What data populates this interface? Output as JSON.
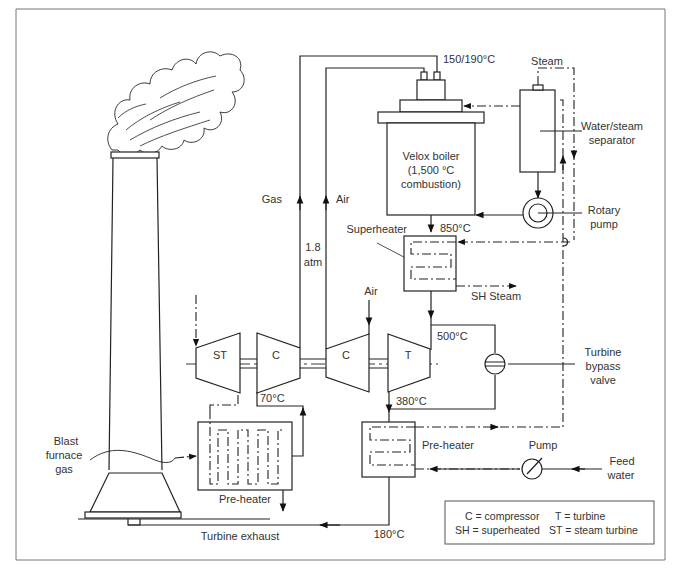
{
  "diagram": {
    "type": "process flow schematic",
    "components": {
      "chimney": "chimney-stack",
      "boiler": {
        "line1": "Velox boiler",
        "line2": "(1,500 °C",
        "line3": "combustion)"
      },
      "separator": {
        "line1": "Water/steam",
        "line2": "separator"
      },
      "rotary_pump": {
        "line1": "Rotary",
        "line2": "pump"
      },
      "superheater": "Superheater",
      "bypass_valve": {
        "line1": "Turbine",
        "line2": "bypass",
        "line3": "valve"
      },
      "preheater_right": "Pre-heater",
      "preheater_left": "Pre-heater",
      "pump": "Pump",
      "feed_water": {
        "line1": "Feed",
        "line2": "water"
      },
      "blast_gas": {
        "line1": "Blast",
        "line2": "furnace",
        "line3": "gas"
      },
      "machines": {
        "st": "ST",
        "c1": "C",
        "c2": "C",
        "t": "T"
      }
    },
    "flow_labels": {
      "gas": "Gas",
      "air_up": "Air",
      "air_in": "Air",
      "pressure_1": "1.8",
      "pressure_2": "atm",
      "steam": "Steam",
      "sh_steam": "SH Steam",
      "turbine_exhaust": "Turbine exhaust"
    },
    "temperatures": {
      "boiler_inlet": "150/190°C",
      "superheater_in": "850°C",
      "turbine_in": "500°C",
      "turbine_out": "380°C",
      "compressor_out": "70°C",
      "exhaust": "180°C"
    },
    "legend": {
      "row1_left": "C = compressor",
      "row1_right": "T = turbine",
      "row2_left": "SH = superheated",
      "row2_right": "ST = steam turbine"
    }
  }
}
